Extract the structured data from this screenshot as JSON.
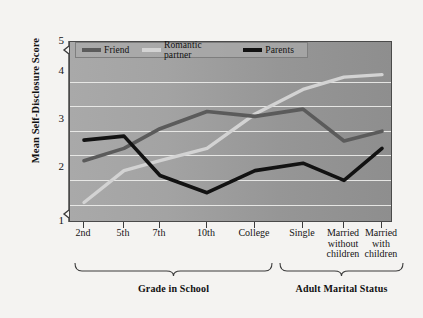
{
  "chart_data": {
    "type": "line",
    "title": "",
    "xlabel": "",
    "ylabel": "Mean Self-Disclosure Score",
    "ylim": [
      1,
      5
    ],
    "yticks": [
      1,
      2,
      3,
      4,
      5
    ],
    "ytick_labels": [
      "1",
      "2",
      "3",
      "4",
      "5"
    ],
    "axis_break": "between 1 and 2",
    "grid": "horizontal gridlines at 2, 2.5, 3, 3.5, 4, 4.5",
    "gridlines": [
      2,
      2.5,
      3,
      3.5,
      4,
      4.5
    ],
    "legend_position": "top-left inside plot area",
    "categories": [
      "2nd",
      "5th",
      "7th",
      "10th",
      "College",
      "Single",
      "Married without children",
      "Married with children"
    ],
    "series": [
      {
        "name": "Friend",
        "color": "#5b5b5b",
        "values": [
          2.9,
          3.15,
          3.55,
          3.9,
          3.8,
          3.95,
          3.3,
          3.5
        ]
      },
      {
        "name": "Romantic partner",
        "color": "#d3d3d3",
        "values": [
          2.05,
          2.7,
          2.9,
          3.15,
          3.85,
          4.35,
          4.6,
          4.65
        ]
      },
      {
        "name": "Parents",
        "color": "#121212",
        "values": [
          3.32,
          3.4,
          2.6,
          2.25,
          2.7,
          2.85,
          2.5,
          3.15
        ]
      }
    ],
    "groups": [
      {
        "label": "Grade in School",
        "categories": [
          "2nd",
          "5th",
          "7th",
          "10th",
          "College"
        ]
      },
      {
        "label": "Adult Marital Status",
        "categories": [
          "Single",
          "Married without children",
          "Married with children"
        ]
      }
    ]
  },
  "legend": {
    "items": [
      {
        "label": "Friend"
      },
      {
        "label": "Romantic partner"
      },
      {
        "label": "Parents"
      }
    ]
  },
  "axis": {
    "y_title": "Mean Self-Disclosure Score",
    "y_labels": [
      "5",
      "4",
      "3",
      "2",
      "1"
    ],
    "x_labels": [
      {
        "line1": "2nd",
        "line2": "",
        "line3": ""
      },
      {
        "line1": "5th",
        "line2": "",
        "line3": ""
      },
      {
        "line1": "7th",
        "line2": "",
        "line3": ""
      },
      {
        "line1": "10th",
        "line2": "",
        "line3": ""
      },
      {
        "line1": "College",
        "line2": "",
        "line3": ""
      },
      {
        "line1": "Single",
        "line2": "",
        "line3": ""
      },
      {
        "line1": "Married",
        "line2": "without",
        "line3": "children"
      },
      {
        "line1": "Married",
        "line2": "with",
        "line3": "children"
      }
    ]
  },
  "groups": {
    "labels": [
      "Grade in School",
      "Adult Marital Status"
    ]
  },
  "colors": {
    "friend": "#5b5b5b",
    "romantic_partner": "#d3d3d3",
    "parents": "#121212",
    "plot_background": "#9d9d9d",
    "gridline": "#ededea",
    "page_background": "#f4f3f1"
  }
}
